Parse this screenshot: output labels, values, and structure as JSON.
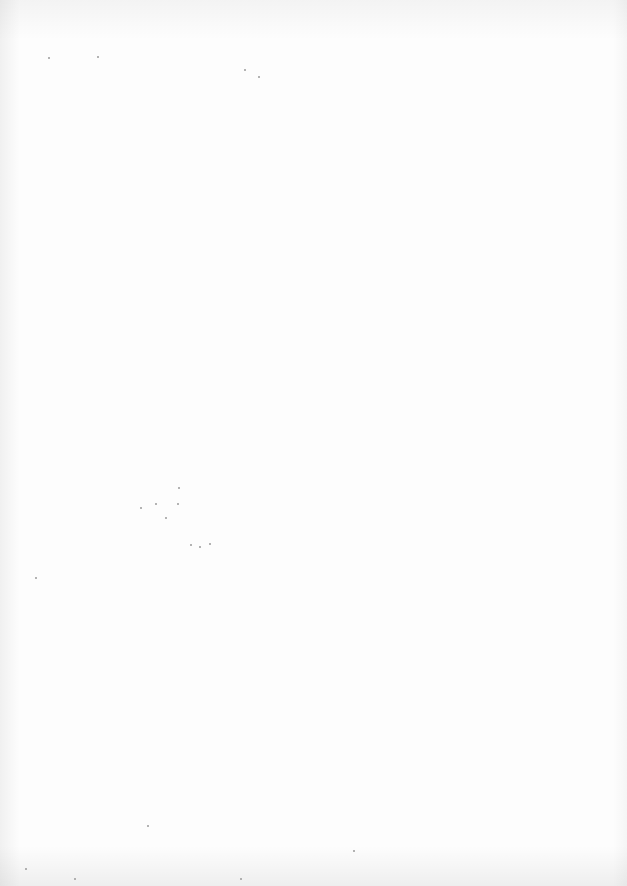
{
  "page": {
    "description": "Blank scanned page",
    "background_color": "#fdfdfd",
    "speck_color": "#9a9a9a"
  }
}
